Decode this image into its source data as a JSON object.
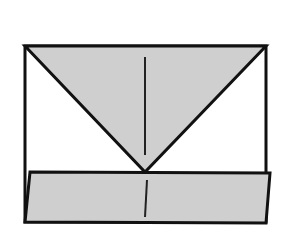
{
  "diagram": {
    "type": "origami-fold-step",
    "colors": {
      "background": "#ffffff",
      "paper_fill": "#cfcfcf",
      "outline": "#111111",
      "crease": "#222222"
    },
    "paper_rectangle": {
      "top_left": [
        25,
        46
      ],
      "top_right": [
        266,
        46
      ],
      "bottom_right": [
        266,
        222
      ],
      "bottom_left": [
        25,
        222
      ]
    },
    "folded_triangle": {
      "points": [
        [
          25,
          46
        ],
        [
          266,
          46
        ],
        [
          145,
          172
        ]
      ]
    },
    "folded_bottom_band": {
      "points": [
        [
          30,
          172
        ],
        [
          270,
          173
        ],
        [
          266,
          223
        ],
        [
          25,
          222
        ]
      ]
    },
    "creases": [
      {
        "from": [
          145,
          57
        ],
        "to": [
          145,
          155
        ]
      },
      {
        "from": [
          147,
          180
        ],
        "to": [
          145,
          217
        ]
      }
    ]
  }
}
